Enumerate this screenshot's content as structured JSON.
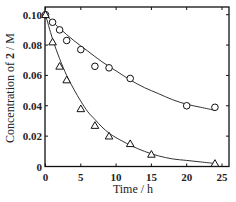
{
  "chart_data": {
    "type": "scatter",
    "title": "",
    "xlabel": "Time / h",
    "ylabel_parts": [
      "Concentration of ",
      "2",
      " / M"
    ],
    "ylabel": "Concentration of 2 / M",
    "xlim": [
      0,
      26
    ],
    "ylim": [
      0,
      0.1
    ],
    "xticks": [
      0,
      5,
      10,
      15,
      20,
      25
    ],
    "xtick_labels": [
      "0",
      "5",
      "10",
      "15",
      "20",
      "25"
    ],
    "yticks": [
      0,
      0.02,
      0.04,
      0.06,
      0.08,
      0.1
    ],
    "ytick_labels": [
      "0",
      "0.02",
      "0.04",
      "0.06",
      "0.08",
      "0.10"
    ],
    "grid": false,
    "legend": null,
    "series": [
      {
        "name": "circles",
        "marker": "circle",
        "x": [
          0,
          1,
          2,
          3,
          5,
          7,
          9,
          12,
          20,
          24
        ],
        "y": [
          0.1,
          0.095,
          0.09,
          0.083,
          0.077,
          0.066,
          0.065,
          0.058,
          0.04,
          0.039
        ],
        "fit_curve": {
          "x": [
            0,
            2,
            4,
            6,
            8,
            10,
            12,
            14,
            16,
            18,
            20,
            22,
            24
          ],
          "y": [
            0.1,
            0.091,
            0.083,
            0.076,
            0.069,
            0.063,
            0.057,
            0.052,
            0.048,
            0.044,
            0.041,
            0.039,
            0.037
          ]
        }
      },
      {
        "name": "triangles",
        "marker": "triangle",
        "x": [
          0,
          1,
          2,
          3,
          5,
          7,
          9,
          12,
          15,
          24
        ],
        "y": [
          0.1,
          0.082,
          0.066,
          0.057,
          0.038,
          0.027,
          0.02,
          0.015,
          0.008,
          0.002
        ],
        "fit_curve": {
          "x": [
            0,
            1,
            2,
            3,
            4,
            5,
            6,
            7,
            8,
            9,
            10,
            12,
            14,
            16,
            18,
            20,
            22,
            24
          ],
          "y": [
            0.1,
            0.084,
            0.071,
            0.06,
            0.051,
            0.043,
            0.036,
            0.031,
            0.026,
            0.022,
            0.019,
            0.014,
            0.01,
            0.007,
            0.005,
            0.004,
            0.003,
            0.002
          ]
        }
      }
    ]
  }
}
